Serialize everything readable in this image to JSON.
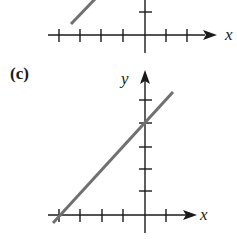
{
  "figure": {
    "panels": [
      {
        "id": "b-partial",
        "label": "",
        "x_axis_label": "x",
        "y_axis_label": "",
        "line_color": "#707070"
      },
      {
        "id": "c",
        "label": "(c)",
        "x_axis_label": "x",
        "y_axis_label": "y",
        "line_color": "#707070",
        "line_description": "positively sloped line crossing y-axis at the second tick above origin and x-axis at the fourth tick left of origin"
      }
    ]
  },
  "colors": {
    "axis": "#1a1a1a",
    "line": "#707070",
    "background": "#ffffff"
  }
}
